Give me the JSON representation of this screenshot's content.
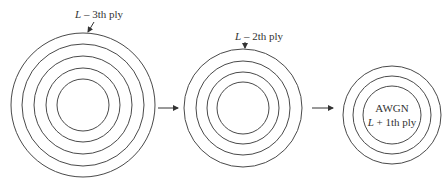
{
  "diagram": {
    "stages": [
      {
        "label_var": "L",
        "label_rest": " – 3th ply",
        "rings": 5
      },
      {
        "label_var": "L",
        "label_rest": " – 2th ply",
        "rings": 4
      },
      {
        "inner_line1": "AWGN",
        "label_var": "L",
        "label_rest": " + 1th ply",
        "rings": 3
      }
    ],
    "colors": {
      "stroke": "#4a4a4a",
      "text": "#333333",
      "background": "#ffffff"
    }
  }
}
